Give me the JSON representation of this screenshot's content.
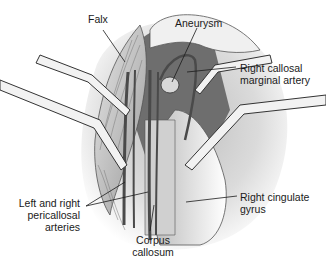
{
  "figure": {
    "labels": {
      "falx": "Falx",
      "aneurysm": "Aneurysm",
      "right_callosal_marginal_artery_line1": "Right callosal",
      "right_callosal_marginal_artery_line2": "marginal artery",
      "pericallosal_line1": "Left and right",
      "pericallosal_line2": "pericallosal",
      "pericallosal_line3": "arteries",
      "corpus_callosum_line1": "Corpus",
      "corpus_callosum_line2": "callosum",
      "right_cingulate_gyrus_line1": "Right cingulate",
      "right_cingulate_gyrus_line2": "gyrus"
    },
    "colors": {
      "background": "#ffffff",
      "dark_cavity": "#6e6e6e",
      "tissue_light": "#d9d9d9",
      "tissue_mid": "#a8a8a8",
      "vessel": "#4a4a4a",
      "retractor": "#f2f2f2",
      "line": "#1a1a1a"
    }
  }
}
